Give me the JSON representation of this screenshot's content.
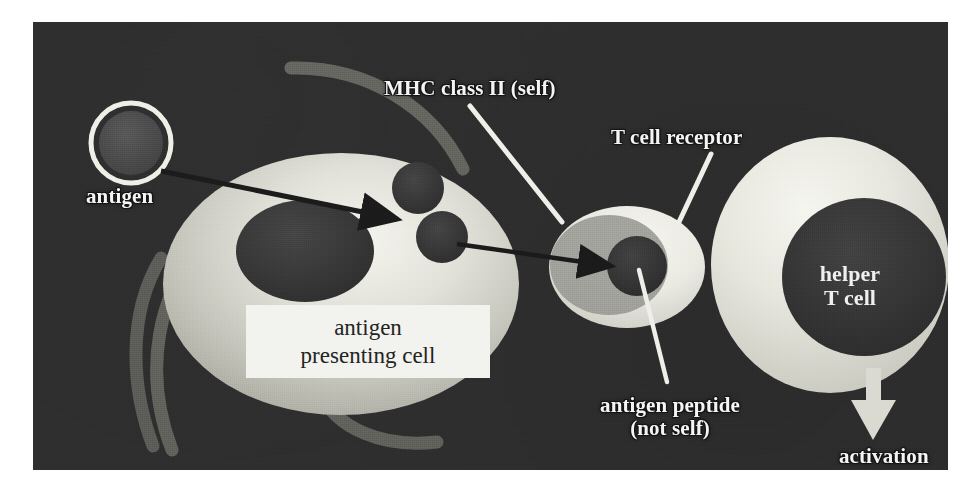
{
  "figure": {
    "frame": {
      "x": 33,
      "y": 22,
      "width": 915,
      "height": 448
    }
  },
  "colors": {
    "background_outer": "#ffffff",
    "background_dark": "#2e2e2e",
    "cell_light": "#d8d8d0",
    "cell_light_bright": "#f2f2ec",
    "nucleus_dark": "#3a3a3a",
    "vesicle_dark": "#3a3a3a",
    "mhc_overlay_gray": "#9a9a94",
    "dendrite_gray": "#6e6e68",
    "leader_line": "#f0f0ea",
    "arrow_dark": "#1d1d1d",
    "arrow_light": "#dcdcd4",
    "label_text": "#f4f4f4",
    "apc_box_bg": "#f2f2ee",
    "apc_box_text": "#232323"
  },
  "labels": {
    "antigen": "antigen",
    "mhc_class_ii": "MHC class II (self)",
    "t_cell_receptor": "T cell receptor",
    "apc_line1": "antigen",
    "apc_line2": "presenting cell",
    "helper_t_line1": "helper",
    "helper_t_line2": "T cell",
    "antigen_peptide_line1": "antigen peptide",
    "antigen_peptide_line2": "(not self)",
    "activation": "activation"
  },
  "elements": {
    "antigen_particle": {
      "name": "antigen",
      "shape": "ring-circle",
      "cx": 98,
      "cy": 121,
      "r": 41,
      "ring_color": "#efefe8",
      "core_color": "#4b4b4b"
    },
    "antigen_presenting_cell": {
      "name": "antigen presenting cell",
      "shape": "ellipse",
      "cx": 308,
      "cy": 262,
      "rx": 178,
      "ry": 131
    },
    "apc_nucleus": {
      "name": "nucleus",
      "shape": "ellipse",
      "cx": 272,
      "cy": 229,
      "rx": 68,
      "ry": 50
    },
    "apc_vesicle_upper": {
      "name": "vesicle",
      "shape": "circle",
      "cx": 385,
      "cy": 166,
      "r": 25
    },
    "apc_vesicle_lower": {
      "name": "vesicle",
      "shape": "circle",
      "cx": 409,
      "cy": 215,
      "r": 25
    },
    "mhc_complex": {
      "name": "MHC class II molecule",
      "shape": "ellipse",
      "cx": 594,
      "cy": 245,
      "rx": 77,
      "ry": 60
    },
    "mhc_overlay": {
      "name": "MHC binding groove overlay",
      "shape": "ellipse",
      "cx": 578,
      "cy": 243,
      "rx": 58,
      "ry": 49
    },
    "antigen_peptide": {
      "name": "antigen peptide",
      "shape": "circle",
      "cx": 604,
      "cy": 244,
      "r": 29
    },
    "helper_t_cell": {
      "name": "helper T cell",
      "shape": "ellipse",
      "cx": 797,
      "cy": 243,
      "rx": 118,
      "ry": 127
    },
    "helper_t_nucleus": {
      "name": "helper T cell nucleus",
      "shape": "ellipse",
      "cx": 830,
      "cy": 255,
      "rx": 81,
      "ry": 78
    },
    "uptake_arrow": {
      "name": "antigen uptake arrow",
      "from": [
        128,
        150
      ],
      "to": [
        373,
        200
      ],
      "color": "#1d1d1d"
    },
    "presentation_arrow": {
      "name": "peptide presentation arrow",
      "from": [
        425,
        222
      ],
      "to": [
        585,
        244
      ],
      "color": "#1d1d1d"
    },
    "activation_arrow": {
      "name": "activation arrow",
      "from": [
        840,
        374
      ],
      "to": [
        840,
        415
      ],
      "color": "#dcdcd4"
    },
    "leader_lines": [
      {
        "name": "mhc-leader",
        "from": [
          437,
          86
        ],
        "to": [
          527,
          197
        ]
      },
      {
        "name": "tcr-leader",
        "from": [
          676,
          133
        ],
        "to": [
          645,
          199
        ]
      },
      {
        "name": "peptide-leader",
        "from": [
          608,
          250
        ],
        "to": [
          634,
          362
        ]
      }
    ],
    "dendrites": [
      {
        "name": "dendrite-upper",
        "path": "upper-arc"
      },
      {
        "name": "dendrite-left",
        "path": "left-arc"
      },
      {
        "name": "dendrite-lower-left",
        "path": "lower-left-arc"
      },
      {
        "name": "dendrite-lower-right",
        "path": "lower-right-arc"
      }
    ]
  }
}
